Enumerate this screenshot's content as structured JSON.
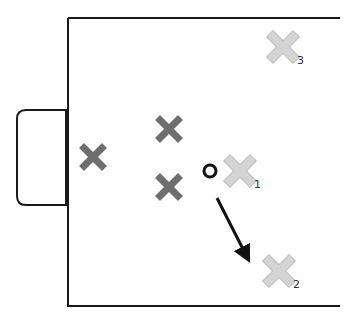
{
  "diagram": {
    "type": "soccer-tactics",
    "colors": {
      "line": "#1a1a1a",
      "defender": "#6e6e6e",
      "attacker": "#d4d4d4",
      "attacker_stroke": "#bdbdbd",
      "ball": "#111111",
      "arrow": "#111111"
    },
    "defenders": [
      {
        "id": "d1",
        "x": 93,
        "y": 157
      },
      {
        "id": "d2",
        "x": 169,
        "y": 129
      },
      {
        "id": "d3",
        "x": 169,
        "y": 187
      }
    ],
    "attackers": [
      {
        "id": "a1",
        "x": 240,
        "y": 171,
        "label": "1"
      },
      {
        "id": "a2",
        "x": 279,
        "y": 271,
        "label": "2"
      },
      {
        "id": "a3",
        "x": 283,
        "y": 47,
        "label": "3"
      }
    ],
    "ball": {
      "x": 210,
      "y": 171
    },
    "pass_arrow": {
      "x1": 217,
      "y1": 198,
      "x2": 246,
      "y2": 255
    }
  }
}
